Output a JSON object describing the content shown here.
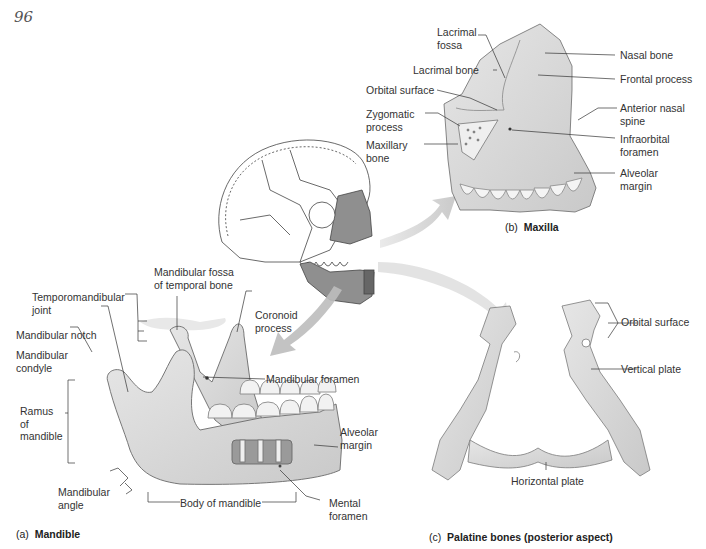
{
  "page_number_handwritten": "96",
  "figures": {
    "maxilla": {
      "caption_letter": "(b)",
      "caption_title": "Maxilla",
      "labels": {
        "lacrimal_fossa": "Lacrimal\nfossa",
        "lacrimal_bone": "Lacrimal bone",
        "orbital_surface": "Orbital surface",
        "zygomatic_process": "Zygomatic\nprocess",
        "maxillary_bone": "Maxillary\nbone",
        "nasal_bone": "Nasal bone",
        "frontal_process": "Frontal process",
        "anterior_nasal_spine": "Anterior nasal\nspine",
        "infraorbital_foramen": "Infraorbital\nforamen",
        "alveolar_margin": "Alveolar\nmargin"
      }
    },
    "mandible": {
      "caption_letter": "(a)",
      "caption_title": "Mandible",
      "labels": {
        "mandibular_fossa": "Mandibular fossa\nof temporal bone",
        "temporomandibular_joint": "Temporomandibular\njoint",
        "coronoid_process": "Coronoid\nprocess",
        "mandibular_notch": "Mandibular notch",
        "mandibular_condyle": "Mandibular\ncondyle",
        "mandibular_foramen": "Mandibular foramen",
        "ramus": "Ramus\nof\nmandible",
        "alveolar_margin": "Alveolar\nmargin",
        "mandibular_angle": "Mandibular\nangle",
        "body": "Body of mandible",
        "mental_foramen": "Mental\nforamen"
      }
    },
    "palatine": {
      "caption_letter": "(c)",
      "caption_title": "Palatine bones (posterior aspect)",
      "labels": {
        "orbital_surface": "Orbital surface",
        "vertical_plate": "Vertical plate",
        "horizontal_plate": "Horizontal plate"
      }
    }
  },
  "colors": {
    "bone_fill": "#d9d9d9",
    "bone_shade": "#bdbdbd",
    "highlight_fill": "#8f8f8f",
    "arrow": "#c8c8c8",
    "leader_line": "#333333",
    "text": "#333333"
  }
}
